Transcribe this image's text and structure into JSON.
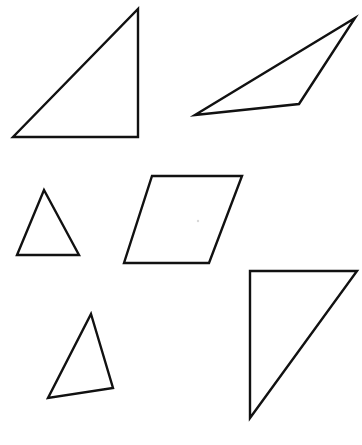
{
  "figure": {
    "background_color": "#ffffff",
    "stroke_color": "#111111",
    "fill_color": "#ffffff",
    "stroke_width": 2.4,
    "canvas": {
      "width": 362,
      "height": 445
    },
    "shape_count": "6"
  },
  "shapes": [
    {
      "id": "shape-1",
      "name": "large-right-triangle",
      "label": "Large right triangle",
      "sides": "3",
      "points": "13,137 138,137 138,9",
      "vertices": [
        [
          13,
          137
        ],
        [
          138,
          137
        ],
        [
          138,
          9
        ]
      ],
      "position": "top-left"
    },
    {
      "id": "shape-2",
      "name": "obtuse-scalene-triangle",
      "label": "Thin obtuse triangle",
      "sides": "3",
      "points": "195,115 299,104 355,18",
      "vertices": [
        [
          195,
          115
        ],
        [
          299,
          104
        ],
        [
          355,
          18
        ]
      ],
      "position": "top-right"
    },
    {
      "id": "shape-3",
      "name": "small-isosceles-triangle",
      "label": "Small isosceles triangle",
      "sides": "3",
      "points": "44,190 79,255 17,255",
      "vertices": [
        [
          44,
          190
        ],
        [
          79,
          255
        ],
        [
          17,
          255
        ]
      ],
      "position": "middle-left"
    },
    {
      "id": "shape-4",
      "name": "parallelogram",
      "label": "Parallelogram",
      "sides": "4",
      "points": "152,176 242,176 209,263 124,263",
      "vertices": [
        [
          152,
          176
        ],
        [
          242,
          176
        ],
        [
          209,
          263
        ],
        [
          124,
          263
        ]
      ],
      "position": "middle-center"
    },
    {
      "id": "shape-5",
      "name": "scalene-triangle",
      "label": "Tilted scalene triangle",
      "sides": "3",
      "points": "91,314 113,388 48,398",
      "vertices": [
        [
          91,
          314
        ],
        [
          113,
          388
        ],
        [
          48,
          398
        ]
      ],
      "position": "bottom-left"
    },
    {
      "id": "shape-6",
      "name": "tall-right-triangle",
      "label": "Tall right triangle",
      "sides": "3",
      "points": "250,271 357,271 250,418",
      "vertices": [
        [
          250,
          271
        ],
        [
          357,
          271
        ],
        [
          250,
          418
        ]
      ],
      "position": "bottom-right"
    }
  ],
  "marks": [
    {
      "id": "mark-1",
      "name": "stray-speck",
      "label": "Faint speck inside parallelogram",
      "cx": "198",
      "cy": "221",
      "r": "1.2",
      "color": "#d9d9d9"
    }
  ]
}
